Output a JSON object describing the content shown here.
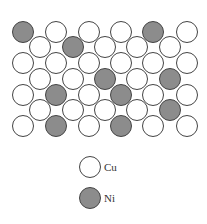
{
  "diagram": {
    "type": "atomic-lattice",
    "colors": {
      "cu_fill": "#ffffff",
      "ni_fill": "#8c8c8c",
      "stroke": "#444444"
    },
    "radius": 10.5,
    "rows": [
      {
        "y": 32,
        "x": [
          23,
          56,
          89,
          121,
          153,
          187
        ],
        "ni": [
          0,
          4
        ]
      },
      {
        "y": 47,
        "x": [
          40,
          73,
          105,
          137,
          170
        ],
        "ni": [
          1
        ]
      },
      {
        "y": 63,
        "x": [
          23,
          56,
          89,
          121,
          153,
          187
        ],
        "ni": []
      },
      {
        "y": 79,
        "x": [
          40,
          73,
          105,
          137,
          170
        ],
        "ni": [
          2,
          4
        ]
      },
      {
        "y": 95,
        "x": [
          23,
          56,
          89,
          121,
          153,
          187
        ],
        "ni": [
          1,
          3
        ]
      },
      {
        "y": 110,
        "x": [
          40,
          73,
          105,
          137,
          170
        ],
        "ni": [
          4
        ]
      },
      {
        "y": 126,
        "x": [
          23,
          56,
          89,
          121,
          153,
          187
        ],
        "ni": [
          1,
          3
        ]
      }
    ]
  },
  "legend": {
    "items": [
      {
        "label": "Cu",
        "element": "cu",
        "cx": 90,
        "cy": 167
      },
      {
        "label": "Ni",
        "element": "ni",
        "cx": 90,
        "cy": 198
      }
    ]
  }
}
